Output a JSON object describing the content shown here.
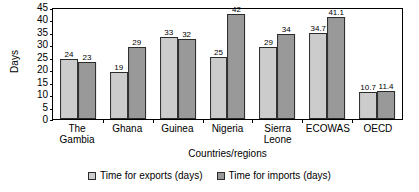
{
  "chart_data": {
    "type": "bar",
    "title": "",
    "xlabel": "Countries/regions",
    "ylabel": "Days",
    "ylim": [
      0,
      45
    ],
    "ytick_step": 5,
    "yticks": [
      0,
      5,
      10,
      15,
      20,
      25,
      30,
      35,
      40,
      45
    ],
    "grid": false,
    "legend_position": "bottom",
    "categories": [
      "The Gambia",
      "Ghana",
      "Guinea",
      "Nigeria",
      "Sierra\nLeone",
      "ECOWAS",
      "OECD"
    ],
    "series": [
      {
        "name": "Time for exports (days)",
        "color": "#cccccc",
        "values": [
          24,
          19,
          33,
          25,
          29,
          34.7,
          10.7
        ],
        "labels": [
          "24",
          "19",
          "33",
          "25",
          "29",
          "34.7",
          "10.7"
        ]
      },
      {
        "name": "Time for imports (days)",
        "color": "#999999",
        "values": [
          23,
          29,
          32,
          42,
          34,
          41.1,
          11.4
        ],
        "labels": [
          "23",
          "29",
          "32",
          "42",
          "34",
          "41.1",
          "11.4"
        ]
      }
    ]
  }
}
